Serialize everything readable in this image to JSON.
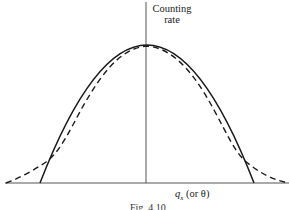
{
  "figure": {
    "caption": "Fig. 4.10",
    "y_axis_label_line1": "Counting",
    "y_axis_label_line2": "rate",
    "x_axis_label_symbol": "q",
    "x_axis_label_sub": "x",
    "x_axis_label_rest": " (or θ)",
    "colors": {
      "line": "#1a1a1a",
      "background": "#ffffff"
    }
  },
  "curves": [
    {
      "name": "solid-parabolic-curve",
      "style": "solid",
      "description": "inverted parabola, finite width"
    },
    {
      "name": "dashed-gaussian-curve",
      "style": "dashed",
      "description": "Gaussian-like with long tails"
    }
  ]
}
